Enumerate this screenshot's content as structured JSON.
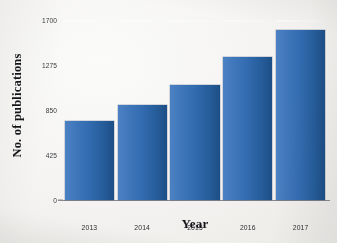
{
  "chart_data": {
    "type": "bar",
    "title": "",
    "xlabel": "Year",
    "ylabel": "No. of publications",
    "categories": [
      "2013",
      "2014",
      "2015",
      "2016",
      "2017"
    ],
    "values": [
      745,
      895,
      1085,
      1350,
      1605
    ],
    "ylim": [
      0,
      1700
    ],
    "yticks": [
      "0",
      "425",
      "850",
      "1275",
      "1700"
    ],
    "ytick_values": [
      0,
      425,
      850,
      1275,
      1700
    ],
    "grid": false,
    "legend": false,
    "bar_color_light": "#4c82c3",
    "bar_color_dark": "#1d4f86",
    "axis_color": "#8c8c90",
    "background": "#f4f3f1"
  }
}
